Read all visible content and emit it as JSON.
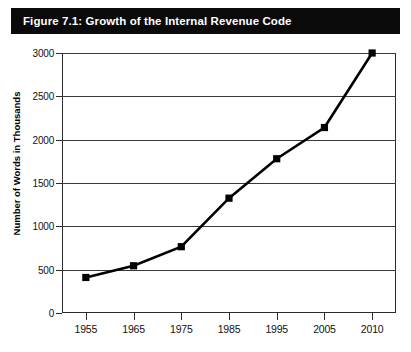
{
  "figure": {
    "title": "Figure 7.1: Growth of the Internal Revenue Code",
    "title_band_color": "#0a0a0a",
    "title_text_color": "#ffffff",
    "background_color": "#ffffff"
  },
  "chart_data": {
    "type": "line",
    "title": "Figure 7.1: Growth of the Internal Revenue Code",
    "xlabel": "",
    "ylabel": "Number of Words in Thousands",
    "categories": [
      "1955",
      "1965",
      "1975",
      "1985",
      "1995",
      "2005",
      "2010"
    ],
    "values": [
      410,
      545,
      765,
      1325,
      1780,
      2140,
      3000
    ],
    "ylim": [
      0,
      3000
    ],
    "yticks": [
      "0",
      "500",
      "1000",
      "1500",
      "2000",
      "2500",
      "3000"
    ],
    "ytick_values": [
      0,
      500,
      1000,
      1500,
      2000,
      2500,
      3000
    ],
    "grid": "horizontal",
    "legend": "none",
    "marker": "square",
    "marker_color": "#000000",
    "line_color": "#000000",
    "line_width": 2.6,
    "axis_color": "#2b2b2b",
    "grid_color": "#3a3a3a"
  }
}
